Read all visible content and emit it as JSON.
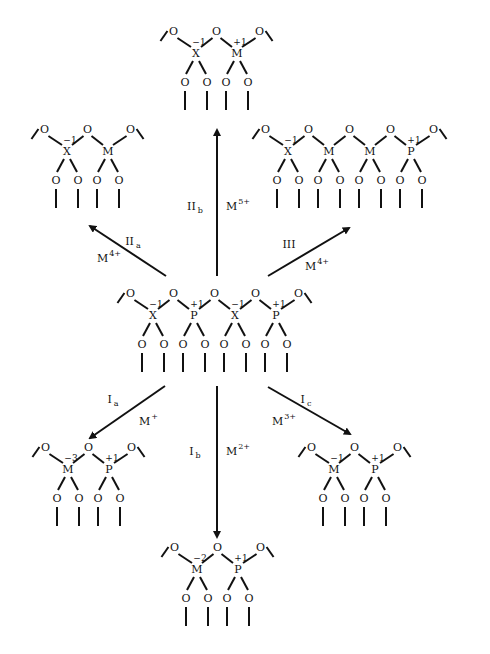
{
  "diagram": {
    "title": "",
    "colors": {
      "ink": "#111111",
      "background": "#ffffff"
    },
    "unit_spacing": 41,
    "structures": [
      {
        "id": "center",
        "name": "center-structure-XPXP",
        "x0": 153,
        "y0": 297,
        "units": [
          {
            "atom": "X",
            "charge": "−1"
          },
          {
            "atom": "P",
            "charge": "+1"
          },
          {
            "atom": "X",
            "charge": "−1"
          },
          {
            "atom": "P",
            "charge": "+1"
          }
        ]
      },
      {
        "id": "IIb",
        "name": "product-IIb-XM",
        "x0": 196,
        "y0": 35,
        "units": [
          {
            "atom": "X",
            "charge": "−1"
          },
          {
            "atom": "M",
            "charge": "+1"
          }
        ]
      },
      {
        "id": "IIa",
        "name": "product-IIa-XM",
        "x0": 67,
        "y0": 133,
        "units": [
          {
            "atom": "X",
            "charge": "−1"
          },
          {
            "atom": "M",
            "charge": ""
          }
        ]
      },
      {
        "id": "III",
        "name": "product-III-XMMP",
        "x0": 288,
        "y0": 133,
        "units": [
          {
            "atom": "X",
            "charge": "−1"
          },
          {
            "atom": "M",
            "charge": ""
          },
          {
            "atom": "M",
            "charge": ""
          },
          {
            "atom": "P",
            "charge": "+1"
          }
        ]
      },
      {
        "id": "Ia",
        "name": "product-Ia-MP",
        "x0": 68,
        "y0": 451,
        "units": [
          {
            "atom": "M",
            "charge": "−3"
          },
          {
            "atom": "P",
            "charge": "+1"
          }
        ]
      },
      {
        "id": "Ic",
        "name": "product-Ic-MP",
        "x0": 334,
        "y0": 451,
        "units": [
          {
            "atom": "M",
            "charge": "−1"
          },
          {
            "atom": "P",
            "charge": "+1"
          }
        ]
      },
      {
        "id": "Ib",
        "name": "product-Ib-MP",
        "x0": 197,
        "y0": 551,
        "units": [
          {
            "atom": "M",
            "charge": "−2"
          },
          {
            "atom": "P",
            "charge": "+1"
          }
        ]
      }
    ],
    "arrows": [
      {
        "id": "IIb",
        "x1": 217,
        "y1": 276,
        "x2": 217,
        "y2": 130,
        "label": "II",
        "label_sub": "b",
        "label_x": 195,
        "label_y": 210,
        "ion": "M",
        "ion_sup": "5+",
        "ion_x": 226,
        "ion_y": 210
      },
      {
        "id": "IIa",
        "x1": 166,
        "y1": 276,
        "x2": 90,
        "y2": 226,
        "label": "II",
        "label_sub": "a",
        "label_x": 133,
        "label_y": 245,
        "ion": "M",
        "ion_sup": "4+",
        "ion_x": 97,
        "ion_y": 262
      },
      {
        "id": "III",
        "x1": 268,
        "y1": 276,
        "x2": 349,
        "y2": 228,
        "label": "III",
        "label_sub": "",
        "label_x": 289,
        "label_y": 248,
        "ion": "M",
        "ion_sup": "4+",
        "ion_x": 305,
        "ion_y": 270
      },
      {
        "id": "Ia",
        "x1": 165,
        "y1": 386,
        "x2": 90,
        "y2": 438,
        "label": "I",
        "label_sub": "a",
        "label_x": 113,
        "label_y": 403,
        "ion": "M",
        "ion_sup": "+",
        "ion_x": 139,
        "ion_y": 425
      },
      {
        "id": "Ib",
        "x1": 217,
        "y1": 386,
        "x2": 217,
        "y2": 537,
        "label": "I",
        "label_sub": "b",
        "label_x": 195,
        "label_y": 455,
        "ion": "M",
        "ion_sup": "2+",
        "ion_x": 226,
        "ion_y": 455
      },
      {
        "id": "Ic",
        "x1": 268,
        "y1": 387,
        "x2": 350,
        "y2": 434,
        "label": "I",
        "label_sub": "c",
        "label_x": 306,
        "label_y": 403,
        "ion": "M",
        "ion_sup": "3+",
        "ion_x": 272,
        "ion_y": 425
      }
    ]
  }
}
